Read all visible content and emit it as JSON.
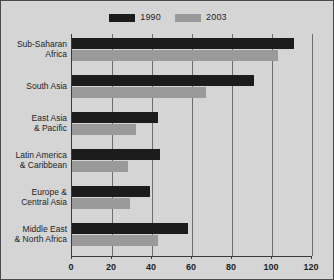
{
  "chart_data": {
    "type": "bar",
    "orientation": "horizontal",
    "title": "",
    "xlabel": "",
    "ylabel": "",
    "xlim": [
      0,
      120
    ],
    "xticks": [
      0,
      20,
      40,
      60,
      80,
      100,
      120
    ],
    "grid": true,
    "legend_position": "top-center",
    "categories": [
      "Sub-Saharan Africa",
      "South Asia",
      "East Asia & Pacific",
      "Latin America & Caribbean",
      "Europe & Central Asia",
      "Middle East & North Africa"
    ],
    "category_lines": [
      [
        "Sub-Saharan",
        "Africa"
      ],
      [
        "South Asia"
      ],
      [
        "East Asia",
        "& Pacific"
      ],
      [
        "Latin America",
        "& Caribbean"
      ],
      [
        "Europe &",
        "Central Asia"
      ],
      [
        "Middle East",
        "& North Africa"
      ]
    ],
    "series": [
      {
        "name": "1990",
        "color": "#1c1c1c",
        "values": [
          111,
          91,
          43,
          44,
          39,
          58
        ]
      },
      {
        "name": "2003",
        "color": "#9a9a9a",
        "values": [
          103,
          67,
          32,
          28,
          29,
          43
        ]
      }
    ]
  },
  "legend": {
    "entries": [
      {
        "label": "1990",
        "color": "#1c1c1c"
      },
      {
        "label": "2003",
        "color": "#9a9a9a"
      }
    ]
  },
  "colors": {
    "background": "#d5d5d5",
    "border": "#4a4a4a",
    "axis": "#3a3a3a",
    "gridline": "#6e6e6e",
    "text": "#1e1e1e",
    "series_1990": "#1c1c1c",
    "series_2003": "#9a9a9a"
  }
}
